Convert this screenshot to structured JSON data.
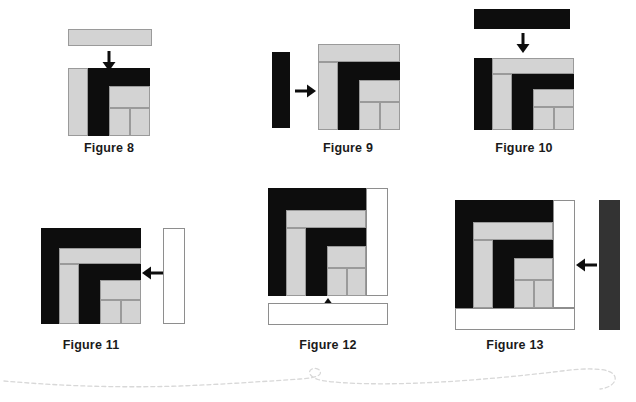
{
  "document": {
    "kind": "geometric-diagram",
    "description": "Sequence of spiral rectangle constructions, Figures 8 through 13",
    "background_color": "#ffffff"
  },
  "palette": {
    "black": "#0d0d0d",
    "gray": "#d3d3d3",
    "gray_border": "#9a9a9a",
    "white": "#ffffff",
    "white_border": "#8e8e8e",
    "dark_gray": "#333333",
    "text": "#1a1a1a",
    "wave": "#d8d8d8"
  },
  "figures": [
    {
      "id": "figure-8",
      "caption": "Figure 8",
      "incoming_piece": {
        "name": "horizontal-gray-bar",
        "fill": "gray",
        "orientation": "horizontal"
      },
      "arrow": {
        "name": "down-arrow",
        "direction": "down"
      }
    },
    {
      "id": "figure-9",
      "caption": "Figure 9",
      "incoming_piece": {
        "name": "vertical-black-bar",
        "fill": "black",
        "orientation": "vertical"
      },
      "arrow": {
        "name": "right-arrow",
        "direction": "right"
      }
    },
    {
      "id": "figure-10",
      "caption": "Figure 10",
      "incoming_piece": {
        "name": "horizontal-black-bar",
        "fill": "black",
        "orientation": "horizontal"
      },
      "arrow": {
        "name": "down-arrow",
        "direction": "down"
      }
    },
    {
      "id": "figure-11",
      "caption": "Figure 11",
      "incoming_piece": {
        "name": "vertical-white-bar",
        "fill": "white",
        "orientation": "vertical"
      },
      "arrow": {
        "name": "left-arrow",
        "direction": "left"
      }
    },
    {
      "id": "figure-12",
      "caption": "Figure 12",
      "incoming_piece": {
        "name": "horizontal-white-bar",
        "fill": "white",
        "orientation": "horizontal"
      },
      "arrow": {
        "name": "up-arrow",
        "direction": "up"
      }
    },
    {
      "id": "figure-13",
      "caption": "Figure 13",
      "incoming_piece": {
        "name": "vertical-dark-gray-bar",
        "fill": "dark_gray",
        "orientation": "vertical"
      },
      "arrow": {
        "name": "left-arrow",
        "direction": "left"
      }
    }
  ],
  "decoration": {
    "name": "dashed-wave-divider",
    "style": "dashed",
    "color": "#d8d8d8"
  }
}
